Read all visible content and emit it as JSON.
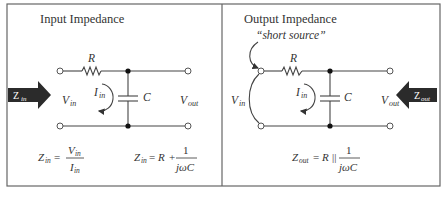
{
  "panels": {
    "left": {
      "title": "Input Impedance",
      "arrow": {
        "main": "Z",
        "sub": "in",
        "direction": "right"
      },
      "labels": {
        "resistor": "R",
        "capacitor": "C",
        "current_main": "I",
        "current_sub": "in",
        "vin_main": "V",
        "vin_sub": "in",
        "vout_main": "V",
        "vout_sub": "out"
      },
      "equations": {
        "eq1": {
          "lhs_main": "Z",
          "lhs_sub": "in",
          "equals": "=",
          "num_main": "V",
          "num_sub": "in",
          "den_main": "I",
          "den_sub": "in"
        },
        "eq2": {
          "lhs_main": "Z",
          "lhs_sub": "in",
          "equals": "=",
          "term": "R",
          "plus": "+",
          "num": "1",
          "den": "jωC"
        }
      }
    },
    "right": {
      "title": "Output Impedance",
      "annotation": "“short source”",
      "arrow": {
        "main": "Z",
        "sub": "out",
        "direction": "left"
      },
      "labels": {
        "resistor": "R",
        "capacitor": "C",
        "current_main": "I",
        "current_sub": "in",
        "vin_main": "V",
        "vin_sub": "in",
        "vout_main": "V",
        "vout_sub": "out"
      },
      "equations": {
        "eq1": {
          "lhs_main": "Z",
          "lhs_sub": "out",
          "equals": "=",
          "term": "R",
          "parallel": "||",
          "num": "1",
          "den": "jωC"
        }
      }
    }
  },
  "colors": {
    "arrow_fill": "#2b2b2b",
    "frame": "#555555",
    "wire": "#444444"
  }
}
